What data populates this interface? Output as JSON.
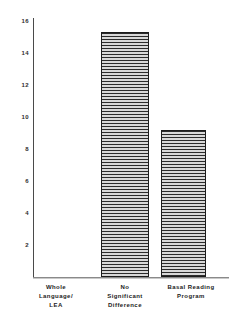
{
  "chart_data": {
    "type": "bar",
    "title": "",
    "subtitle": "",
    "xlabel": "",
    "ylabel": "",
    "categories": [
      "Whole\nLanguage/\nLEA",
      "No\nSignificant\nDifference",
      "Basal  Reading\nProgram"
    ],
    "values": [
      0,
      15.3,
      9.2
    ],
    "ylim": [
      0,
      16
    ],
    "yticks": [
      2,
      4,
      6,
      8,
      10,
      12,
      14,
      16
    ],
    "ytick_labels": [
      "2",
      "4",
      "6",
      "8",
      "10",
      "12",
      "14",
      "16"
    ],
    "grid": false,
    "legend": null,
    "bar_fill": "horizontal-hatch",
    "colors": {
      "bar_hatch_dark": "#2b2b2b",
      "bar_hatch_light": "#d8d8d8",
      "bar_border": "#1c1c1c",
      "axis": "#4a4a4a",
      "text": "#1c1c1c",
      "background": "#ffffff"
    }
  }
}
